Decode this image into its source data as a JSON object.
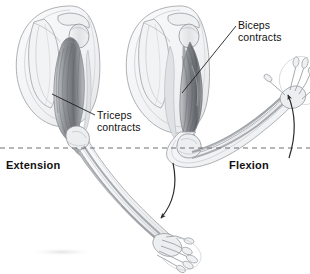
{
  "figure": {
    "background_color": "#ffffff",
    "ink_color": "#111111",
    "width": 310,
    "height": 274
  },
  "labels": {
    "biceps": {
      "line1": "Biceps",
      "line2": "contracts"
    },
    "triceps": {
      "line1": "Triceps",
      "line2": "contracts"
    },
    "extension": "Extension",
    "flexion": "Flexion"
  },
  "annotations": {
    "reference_line": "horizontal-dashed-reference-line",
    "motion_arrow_down": "extension-motion-arrow",
    "motion_arrow_up": "flexion-motion-arrow",
    "leader_biceps": "biceps-leader-line",
    "leader_triceps": "triceps-leader-line"
  },
  "anatomy": {
    "left_arm": "extended-arm-triceps-contracted",
    "right_arm": "flexed-arm-biceps-contracted",
    "structures": [
      "scapula",
      "clavicle",
      "humerus",
      "biceps-brachii",
      "triceps-brachii",
      "radius",
      "ulna",
      "carpals",
      "metacarpals",
      "phalanges"
    ]
  },
  "colors": {
    "outline": "#8d8f93",
    "muscle_dark": "#6f7276",
    "muscle_mid": "#a7abaf",
    "muscle_light": "#d3d6d9",
    "body_fill": "#f4f5f6",
    "bone_fill": "#ecedef",
    "dashed": "#6d6f73"
  }
}
